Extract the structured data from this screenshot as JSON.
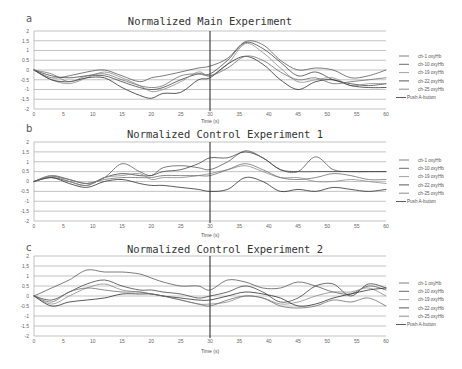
{
  "figure": {
    "panels": [
      {
        "letter": "a",
        "title": "Normalized Main Experiment",
        "xlabel": "Time (s)"
      },
      {
        "letter": "b",
        "title": "Normalized Control Experiment 1",
        "xlabel": "Time (s)"
      },
      {
        "letter": "c",
        "title": "Normalized Control Experiment 2",
        "xlabel": "Time (s)"
      }
    ],
    "legend": [
      "ch-1  oxyHb",
      "ch-10  oxyHb",
      "ch-19  oxyHb",
      "ch-22  oxyHb",
      "ch-25  oxyHb",
      "Push A-button"
    ],
    "series_colors": [
      "#5a5a5a",
      "#444444",
      "#8a8a8a",
      "#2f2f2f",
      "#6e6e6e"
    ],
    "marker_color": "#333333"
  },
  "chart_data": [
    {
      "type": "line",
      "title": "Normalized Main Experiment",
      "panel": "a",
      "xlabel": "Time (s)",
      "ylabel": "",
      "xlim": [
        0,
        60
      ],
      "ylim": [
        -2,
        2
      ],
      "xticks": [
        0,
        5,
        10,
        15,
        20,
        25,
        30,
        35,
        40,
        45,
        50,
        55,
        60
      ],
      "yticks": [
        2,
        1.5,
        1,
        0.5,
        0,
        -0.5,
        -1,
        -1.5,
        -2
      ],
      "grid": true,
      "legend_position": "right",
      "vertical_marker": {
        "x": 30,
        "label": "Push A-button"
      },
      "x": [
        0,
        3,
        6,
        9,
        12,
        15,
        18,
        20,
        22,
        25,
        28,
        30,
        33,
        36,
        39,
        42,
        45,
        48,
        51,
        54,
        57,
        60
      ],
      "series": [
        {
          "name": "ch-1 oxyHb",
          "values": [
            0,
            -0.4,
            -0.3,
            -0.1,
            0,
            -0.3,
            -0.6,
            -0.4,
            -0.3,
            -0.1,
            0.1,
            0.2,
            0.6,
            1.45,
            1.3,
            0.5,
            0.0,
            0.1,
            0.0,
            -0.4,
            -0.3,
            0.0
          ]
        },
        {
          "name": "ch-10 oxyHb",
          "values": [
            0,
            -0.3,
            -0.4,
            -0.3,
            -0.3,
            -0.6,
            -0.9,
            -1.0,
            -0.9,
            -0.5,
            -0.2,
            -0.2,
            0.5,
            1.4,
            1.1,
            0.4,
            -0.3,
            -0.1,
            -0.5,
            -0.7,
            -0.8,
            -0.7
          ]
        },
        {
          "name": "ch-19 oxyHb",
          "values": [
            0,
            -0.5,
            -0.7,
            -0.4,
            -0.1,
            -0.4,
            -0.8,
            -1.1,
            -1.0,
            -0.6,
            -0.1,
            -0.3,
            0.3,
            1.35,
            0.9,
            0.1,
            -0.6,
            -0.5,
            -0.4,
            -0.8,
            -0.7,
            -0.7
          ]
        },
        {
          "name": "ch-22 oxyHb",
          "values": [
            0,
            -0.5,
            -0.6,
            -0.4,
            -0.4,
            -0.9,
            -1.3,
            -1.45,
            -1.2,
            -1.15,
            -0.5,
            -0.4,
            0.3,
            0.7,
            0.3,
            -0.5,
            -1.0,
            -0.6,
            -0.5,
            -0.8,
            -0.9,
            -0.9
          ]
        },
        {
          "name": "ch-25 oxyHb",
          "values": [
            0,
            -0.2,
            -0.6,
            -0.3,
            -0.2,
            -0.5,
            -0.8,
            -0.9,
            -0.8,
            -0.3,
            -0.2,
            -0.3,
            0.1,
            0.7,
            0.5,
            -0.1,
            -0.5,
            -0.4,
            -0.7,
            -0.6,
            -0.5,
            -0.4
          ]
        }
      ]
    },
    {
      "type": "line",
      "title": "Normalized Control Experiment 1",
      "panel": "b",
      "xlabel": "Time (s)",
      "ylabel": "",
      "xlim": [
        0,
        60
      ],
      "ylim": [
        -2,
        2
      ],
      "xticks": [
        0,
        5,
        10,
        15,
        20,
        25,
        30,
        35,
        40,
        45,
        50,
        55,
        60
      ],
      "yticks": [
        2,
        1.5,
        1,
        0.5,
        0,
        -0.5,
        -1,
        -1.5,
        -2
      ],
      "grid": true,
      "legend_position": "right",
      "vertical_marker": {
        "x": 30,
        "label": "Push A-button"
      },
      "x": [
        0,
        3,
        6,
        9,
        12,
        15,
        18,
        20,
        22,
        25,
        28,
        30,
        33,
        36,
        39,
        42,
        45,
        48,
        51,
        54,
        57,
        60
      ],
      "series": [
        {
          "name": "ch-1 oxyHb",
          "values": [
            0,
            0.3,
            0.1,
            -0.1,
            0.2,
            0.9,
            0.5,
            0.3,
            0.7,
            0.8,
            0.7,
            0.6,
            1.0,
            1.55,
            1.2,
            0.6,
            0.5,
            1.25,
            0.6,
            0.5,
            0.5,
            0.5
          ]
        },
        {
          "name": "ch-10 oxyHb",
          "values": [
            0,
            0.2,
            0.0,
            -0.2,
            0.2,
            0.4,
            0.3,
            0.3,
            0.5,
            0.6,
            0.9,
            1.2,
            1.2,
            1.5,
            1.2,
            0.6,
            0.5,
            0.5,
            0.5,
            0.5,
            0.5,
            0.5
          ]
        },
        {
          "name": "ch-19 oxyHb",
          "values": [
            0,
            0.3,
            0.0,
            -0.2,
            0.2,
            0.3,
            0.4,
            0.1,
            0.2,
            0.2,
            0.3,
            0.4,
            0.6,
            0.8,
            0.5,
            0.2,
            0.2,
            0.0,
            0.0,
            0.1,
            0.0,
            -0.1
          ]
        },
        {
          "name": "ch-22 oxyHb",
          "values": [
            0,
            0.2,
            -0.1,
            -0.3,
            0.0,
            0.1,
            -0.1,
            -0.2,
            -0.2,
            -0.3,
            -0.4,
            -0.5,
            -0.4,
            0.2,
            0.0,
            -0.5,
            -0.4,
            -0.5,
            -0.3,
            -0.4,
            -0.5,
            -0.4
          ]
        },
        {
          "name": "ch-25 oxyHb",
          "values": [
            0,
            0.25,
            0.1,
            -0.1,
            0.1,
            0.2,
            0.2,
            0.2,
            0.3,
            0.3,
            0.3,
            0.3,
            0.6,
            0.9,
            0.6,
            0.2,
            0.1,
            0.2,
            0.4,
            0.3,
            0.1,
            0.1
          ]
        }
      ]
    },
    {
      "type": "line",
      "title": "Normalized Control Experiment 2",
      "panel": "c",
      "xlabel": "Time (s)",
      "ylabel": "",
      "xlim": [
        0,
        60
      ],
      "ylim": [
        -2,
        2
      ],
      "xticks": [
        0,
        5,
        10,
        15,
        20,
        25,
        30,
        35,
        40,
        45,
        50,
        55,
        60
      ],
      "yticks": [
        2,
        1.5,
        1,
        0.5,
        0,
        -0.5,
        -1,
        -1.5,
        -2
      ],
      "grid": true,
      "legend_position": "right",
      "vertical_marker": {
        "x": 30,
        "label": "Push A-button"
      },
      "x": [
        0,
        3,
        6,
        9,
        12,
        15,
        18,
        20,
        22,
        25,
        28,
        30,
        33,
        36,
        39,
        42,
        45,
        48,
        51,
        54,
        57,
        60
      ],
      "series": [
        {
          "name": "ch-1 oxyHb",
          "values": [
            0,
            0.4,
            0.8,
            1.3,
            1.2,
            1.2,
            1.1,
            0.9,
            0.7,
            0.5,
            0.5,
            0.3,
            0.8,
            0.7,
            0.4,
            0.4,
            0.7,
            0.5,
            0.2,
            0.1,
            0.5,
            0.3
          ]
        },
        {
          "name": "ch-10 oxyHb",
          "values": [
            0,
            -0.2,
            0.2,
            0.6,
            0.8,
            0.5,
            0.3,
            0.3,
            0.2,
            0.1,
            -0.1,
            0.0,
            0.2,
            0.5,
            0.2,
            -0.3,
            -0.1,
            0.5,
            0.6,
            0.0,
            0.6,
            0.4
          ]
        },
        {
          "name": "ch-19 oxyHb",
          "values": [
            0,
            -0.4,
            0.0,
            0.4,
            0.6,
            0.3,
            0.2,
            0.1,
            0.0,
            -0.2,
            -0.4,
            -0.4,
            -0.3,
            0.0,
            -0.1,
            -0.4,
            -0.3,
            0.0,
            0.2,
            0.2,
            0.4,
            0.0
          ]
        },
        {
          "name": "ch-22 oxyHb",
          "values": [
            0,
            -0.5,
            -0.3,
            -0.2,
            -0.1,
            0.1,
            0.1,
            0.1,
            0.0,
            -0.1,
            -0.2,
            -0.2,
            0.0,
            0.2,
            0.1,
            -0.1,
            -0.5,
            -0.4,
            -0.1,
            0.1,
            0.3,
            0.4
          ]
        },
        {
          "name": "ch-25 oxyHb",
          "values": [
            0,
            -0.3,
            0.2,
            0.4,
            0.3,
            0.2,
            0.2,
            0.1,
            0.0,
            -0.2,
            -0.4,
            -0.5,
            -0.2,
            0.0,
            -0.1,
            -0.5,
            -0.6,
            -0.5,
            -0.2,
            -0.3,
            -0.1,
            -0.5
          ]
        }
      ]
    }
  ]
}
